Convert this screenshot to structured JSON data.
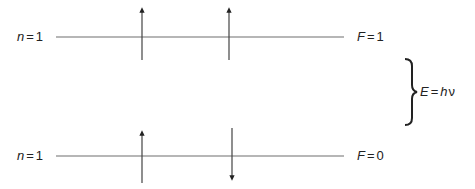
{
  "diagram": {
    "type": "hyperfine-spin-levels",
    "levels": [
      {
        "id": "upper",
        "n_label": {
          "var": "n",
          "eq": "=",
          "value": "1"
        },
        "f_label": {
          "var": "F",
          "eq": "=",
          "value": "1"
        },
        "spins": [
          "up",
          "up"
        ]
      },
      {
        "id": "lower",
        "n_label": {
          "var": "n",
          "eq": "=",
          "value": "1"
        },
        "f_label": {
          "var": "F",
          "eq": "=",
          "value": "0"
        },
        "spins": [
          "up",
          "down"
        ]
      }
    ],
    "energy_gap": {
      "var": "E",
      "eq": "=",
      "h": "h",
      "nu": "ν"
    },
    "colors": {
      "line": "#6e6e6e",
      "arrow": "#333333",
      "text": "#222222",
      "brace": "#222222"
    }
  }
}
